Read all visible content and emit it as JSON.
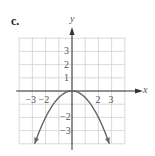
{
  "panel_label": "c.",
  "chart_data": {
    "type": "line",
    "title": "",
    "function": "y = -x^2/2",
    "xlabel": "x",
    "ylabel": "y",
    "xlim": [
      -4,
      4
    ],
    "ylim": [
      -4,
      4
    ],
    "grid": true,
    "x_tick_labels": [
      "-3",
      "-2",
      "2",
      "3"
    ],
    "y_tick_labels": [
      "3",
      "2",
      "1",
      "-2",
      "-3"
    ],
    "series": [
      {
        "name": "parabola",
        "x": [
          -2.83,
          -2,
          -1,
          0,
          1,
          2,
          2.83
        ],
        "y": [
          -4,
          -2,
          -0.5,
          0,
          -0.5,
          -2,
          -4
        ],
        "arrows_at_ends": true
      }
    ],
    "vertex": [
      0,
      0
    ]
  },
  "axis": {
    "x_label": "x",
    "y_label": "y",
    "x_ticks": [
      {
        "label": "−3",
        "v": -3
      },
      {
        "label": "−2",
        "v": -2
      },
      {
        "label": "2",
        "v": 2
      },
      {
        "label": "3",
        "v": 3
      }
    ],
    "y_ticks": [
      {
        "label": "3",
        "v": 3
      },
      {
        "label": "2",
        "v": 2
      },
      {
        "label": "1",
        "v": 1
      },
      {
        "label": "−2",
        "v": -2
      },
      {
        "label": "−3",
        "v": -3
      }
    ]
  },
  "colors": {
    "grid": "#d0d0d0",
    "axis": "#333333",
    "curve": "#666666"
  }
}
